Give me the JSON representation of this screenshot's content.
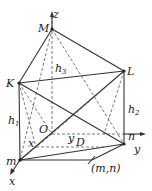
{
  "diagram": {
    "points": {
      "M": {
        "label": "M",
        "x": 52,
        "y": 29
      },
      "K": {
        "label": "K",
        "x": 19,
        "y": 83
      },
      "L": {
        "label": "L",
        "x": 124,
        "y": 71
      },
      "n": {
        "label": "n",
        "x": 124,
        "y": 144
      },
      "m": {
        "label": "m",
        "x": 20,
        "y": 160
      },
      "mn": {
        "label": "(m,n)",
        "x": 92,
        "y": 160
      },
      "O": {
        "label": "O",
        "x": 52,
        "y": 134
      },
      "D": {
        "label": "D"
      }
    },
    "axes": {
      "x": "x",
      "y": "y",
      "z": "z"
    },
    "heights": {
      "h1": "h",
      "h1_sub": "1",
      "h2": "h",
      "h2_sub": "2",
      "h3": "h",
      "h3_sub": "3"
    },
    "labels": {
      "x_inner": "x",
      "y_inner": "y"
    }
  }
}
